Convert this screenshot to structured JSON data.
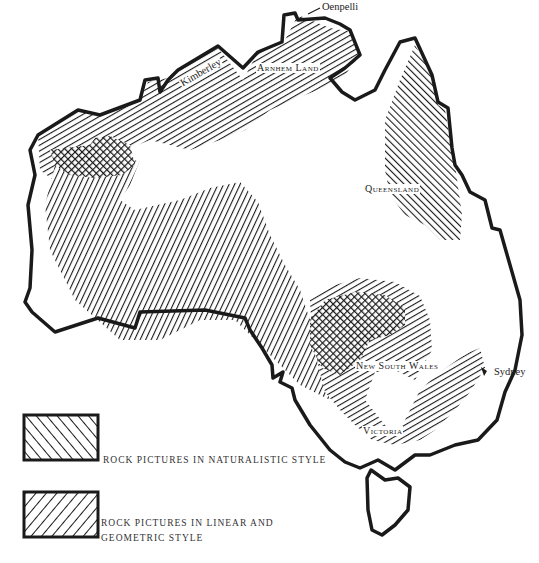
{
  "map": {
    "title": "Distribution of rock pictures in Australia",
    "colors": {
      "ink": "#1a1a1a",
      "background": "#ffffff"
    },
    "labels": {
      "oenpelli": "Oenpelli",
      "arnhem_land": "Arnhem Land",
      "kimberley": "Kimberley",
      "queensland": "Queensland",
      "new_south_wales": "New South Wales",
      "sydney": "Sydney",
      "victoria": "Victoria"
    },
    "regions": [
      {
        "name": "Kimberley / Arnhem Land north coast",
        "style": "linear-geometric"
      },
      {
        "name": "Queensland (Cape York)",
        "style": "naturalistic"
      },
      {
        "name": "Western Australia central band",
        "style": "linear-geometric"
      },
      {
        "name": "Pilbara",
        "style": "overlap"
      },
      {
        "name": "New South Wales",
        "style": "overlap"
      },
      {
        "name": "Victoria / east coast",
        "style": "linear-geometric"
      }
    ]
  },
  "legend": {
    "items": [
      {
        "pattern": "naturalistic",
        "label": "ROCK PICTURES IN NATURALISTIC STYLE"
      },
      {
        "pattern": "linear-geometric",
        "label_line1": "ROCK PICTURES IN LINEAR AND",
        "label_line2": "GEOMETRIC STYLE"
      }
    ]
  }
}
